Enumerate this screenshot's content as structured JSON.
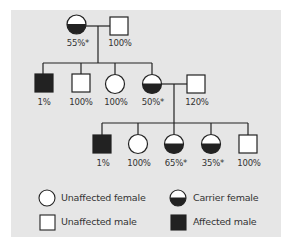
{
  "diagram": {
    "type": "pedigree",
    "colors": {
      "background": "#e6e6e6",
      "line": "#222222",
      "fill_affected": "#222222",
      "fill_unaffected": "#ffffff"
    },
    "generation1": [
      {
        "id": "g1-mother",
        "sex": "female",
        "status": "carrier",
        "label": "55%*"
      },
      {
        "id": "g1-father",
        "sex": "male",
        "status": "unaffected",
        "label": "100%"
      }
    ],
    "generation2": [
      {
        "id": "g2-son1",
        "sex": "male",
        "status": "affected",
        "label": "1%"
      },
      {
        "id": "g2-son2",
        "sex": "male",
        "status": "unaffected",
        "label": "100%"
      },
      {
        "id": "g2-daughter1",
        "sex": "female",
        "status": "unaffected",
        "label": "100%"
      },
      {
        "id": "g2-daughter2",
        "sex": "female",
        "status": "carrier",
        "label": "50%*"
      },
      {
        "id": "g2-spouse",
        "sex": "male",
        "status": "unaffected",
        "label": "120%"
      }
    ],
    "generation3": [
      {
        "id": "g3-son1",
        "sex": "male",
        "status": "affected",
        "label": "1%"
      },
      {
        "id": "g3-daughter1",
        "sex": "female",
        "status": "unaffected",
        "label": "100%"
      },
      {
        "id": "g3-daughter2",
        "sex": "female",
        "status": "carrier",
        "label": "65%*"
      },
      {
        "id": "g3-daughter3",
        "sex": "female",
        "status": "carrier",
        "label": "35%*"
      },
      {
        "id": "g3-son2",
        "sex": "male",
        "status": "unaffected",
        "label": "100%"
      }
    ],
    "legend": {
      "unaffected_female": "Unaffected female",
      "carrier_female": "Carrier female",
      "unaffected_male": "Unaffected male",
      "affected_male": "Affected male"
    }
  }
}
